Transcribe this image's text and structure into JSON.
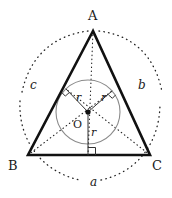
{
  "figure": {
    "vertices": [
      {
        "name": "A",
        "label": "A",
        "x": 93,
        "y": 31,
        "label_x": 88,
        "label_y": 10
      },
      {
        "name": "B",
        "label": "B",
        "x": 28,
        "y": 155,
        "label_x": 8,
        "label_y": 160
      },
      {
        "name": "C",
        "label": "C",
        "x": 150,
        "y": 155,
        "label_x": 152,
        "label_y": 160
      }
    ],
    "incenter": {
      "label": "O",
      "x": 88,
      "y": 112,
      "label_x": 73,
      "label_y": 120
    },
    "incircle": {
      "cx": 88,
      "cy": 112,
      "r": 32,
      "stroke": "#8a8a8a"
    },
    "radii": [
      {
        "name": "radius-to-side-c",
        "label": "r",
        "x2": 66,
        "y2": 89,
        "label_x": 76,
        "label_y": 93
      },
      {
        "name": "radius-to-side-b",
        "label": "r",
        "x2": 112,
        "y2": 91,
        "label_x": 101,
        "label_y": 93
      },
      {
        "name": "radius-to-side-a",
        "label": "r",
        "x2": 88,
        "y2": 155,
        "label_x": 91,
        "label_y": 128
      }
    ],
    "side_labels": [
      {
        "name": "side-a",
        "label": "a",
        "x": 90,
        "y": 177
      },
      {
        "name": "side-b",
        "label": "b",
        "x": 138,
        "y": 80
      },
      {
        "name": "side-c",
        "label": "c",
        "x": 30,
        "y": 80
      }
    ],
    "colors": {
      "triangle": "#111111",
      "circle": "#8a8a8a",
      "dotted": "#222222",
      "text": "#1a1a1a"
    }
  }
}
